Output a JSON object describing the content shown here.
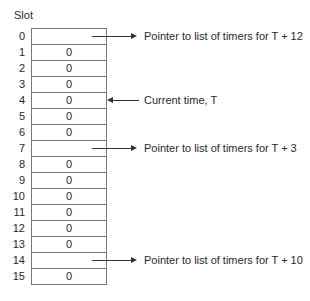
{
  "title": "Slot",
  "slots": [
    {
      "index": "0",
      "value": ""
    },
    {
      "index": "1",
      "value": "0"
    },
    {
      "index": "2",
      "value": "0"
    },
    {
      "index": "3",
      "value": "0"
    },
    {
      "index": "4",
      "value": "0"
    },
    {
      "index": "5",
      "value": "0"
    },
    {
      "index": "6",
      "value": "0"
    },
    {
      "index": "7",
      "value": ""
    },
    {
      "index": "8",
      "value": "0"
    },
    {
      "index": "9",
      "value": "0"
    },
    {
      "index": "10",
      "value": "0"
    },
    {
      "index": "11",
      "value": "0"
    },
    {
      "index": "12",
      "value": "0"
    },
    {
      "index": "13",
      "value": "0"
    },
    {
      "index": "14",
      "value": ""
    },
    {
      "index": "15",
      "value": "0"
    }
  ],
  "annotations": {
    "slot0": "Pointer to list of timers for T + 12",
    "slot4": "Current time, T",
    "slot7": "Pointer to list of timers for T + 3",
    "slot14": "Pointer to list of timers for T + 10"
  }
}
